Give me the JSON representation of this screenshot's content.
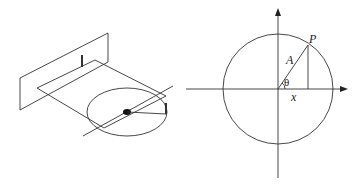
{
  "figure": {
    "left_panel": {
      "description": "Perspective view: point rotating on a circle projected onto a vertical screen (uniform circular motion / simple harmonic motion projection)",
      "elements": [
        "vertical-plane",
        "horizontal-plane",
        "circle",
        "rotation-axis",
        "center-dot",
        "radius-arm",
        "shadow-marker",
        "point-marker"
      ]
    },
    "right_panel": {
      "description": "Reference circle with coordinate axes",
      "labels": {
        "point": "P",
        "radius": "A",
        "angle": "θ",
        "projection": "x"
      }
    },
    "colors": {
      "stroke": "#333333",
      "background": "#ffffff"
    }
  }
}
